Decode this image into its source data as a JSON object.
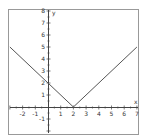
{
  "chart_data": {
    "type": "line",
    "title": "",
    "function": "y = |x - 2|",
    "xlabel": "x",
    "ylabel": "y",
    "xlim": [
      -3,
      7
    ],
    "ylim": [
      -2,
      8
    ],
    "x_ticks": [
      -2,
      -1,
      1,
      2,
      3,
      4,
      5,
      6,
      7
    ],
    "y_ticks": [
      -1,
      1,
      2,
      3,
      4,
      5,
      6,
      7,
      8
    ],
    "grid": false,
    "series": [
      {
        "name": "y = |x - 2|",
        "x": [
          -3,
          0,
          2,
          7
        ],
        "y": [
          5,
          2,
          0,
          5
        ]
      }
    ]
  },
  "colors": {
    "line": "#555555",
    "axis": "#444444",
    "frame": "#999999"
  }
}
